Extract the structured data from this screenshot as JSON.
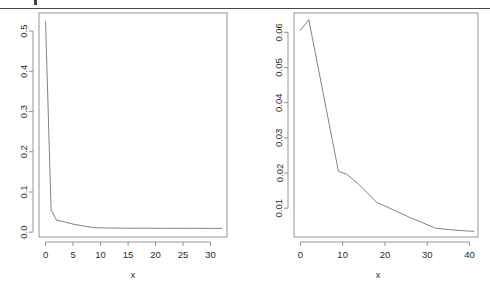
{
  "page": {
    "background": "#ffffff",
    "rule_color": "#4a4a4a",
    "line_color": "#7a7a7a",
    "axis_color": "#8a8a8a",
    "text_color": "#2b2b2b"
  },
  "figures": [
    {
      "id": "left-plot",
      "xlabel": "x",
      "ylabel": "",
      "x_ticks": [
        "0",
        "5",
        "10",
        "15",
        "20",
        "25",
        "30"
      ],
      "y_ticks": [
        "0.0",
        "0.1",
        "0.2",
        "0.3",
        "0.4",
        "0.5"
      ]
    },
    {
      "id": "right-plot",
      "xlabel": "x",
      "ylabel": "",
      "x_ticks": [
        "0",
        "10",
        "20",
        "30",
        "40"
      ],
      "y_ticks": [
        "0.01",
        "0.02",
        "0.03",
        "0.04",
        "0.05",
        "0.06"
      ]
    }
  ],
  "chart_data": [
    {
      "type": "line",
      "id": "left-plot",
      "title": "",
      "xlabel": "x",
      "ylabel": "",
      "xlim": [
        -1.2,
        33.0
      ],
      "ylim": [
        -0.012,
        0.545
      ],
      "x_ticks": [
        0,
        5,
        10,
        15,
        20,
        25,
        30
      ],
      "y_ticks": [
        0.0,
        0.1,
        0.2,
        0.3,
        0.4,
        0.5
      ],
      "grid": false,
      "legend": "none",
      "x": [
        0,
        1,
        2,
        3,
        5,
        7,
        9,
        11,
        14,
        18,
        22,
        26,
        30,
        32
      ],
      "y": [
        0.523,
        0.055,
        0.03,
        0.027,
        0.02,
        0.015,
        0.011,
        0.0105,
        0.01,
        0.0098,
        0.0096,
        0.0095,
        0.0094,
        0.0093
      ]
    },
    {
      "type": "line",
      "id": "right-plot",
      "title": "",
      "xlabel": "x",
      "ylabel": "",
      "xlim": [
        -1.5,
        42.0
      ],
      "ylim": [
        0.0018,
        0.0655
      ],
      "x_ticks": [
        0,
        10,
        20,
        30,
        40
      ],
      "y_ticks": [
        0.01,
        0.02,
        0.03,
        0.04,
        0.05,
        0.06
      ],
      "grid": false,
      "legend": "none",
      "x": [
        0,
        2,
        9,
        11,
        14,
        18,
        22,
        26,
        32,
        36,
        41
      ],
      "y": [
        0.0605,
        0.0636,
        0.0205,
        0.0196,
        0.0166,
        0.0117,
        0.0095,
        0.0073,
        0.0043,
        0.0038,
        0.0034
      ]
    }
  ]
}
